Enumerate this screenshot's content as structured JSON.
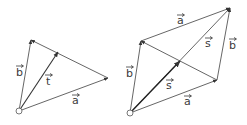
{
  "figure": {
    "left": {
      "labels": {
        "b": "b",
        "t": "t",
        "a": "a"
      }
    },
    "right": {
      "labels": {
        "a_top": "a",
        "s_upper": "s",
        "b_right": "b",
        "b_left": "b",
        "s_lower": "s",
        "a_bottom": "a"
      }
    },
    "colors": {
      "line": "#4a4a4a",
      "label": "#3a3a3a",
      "background": "#ffffff"
    }
  }
}
